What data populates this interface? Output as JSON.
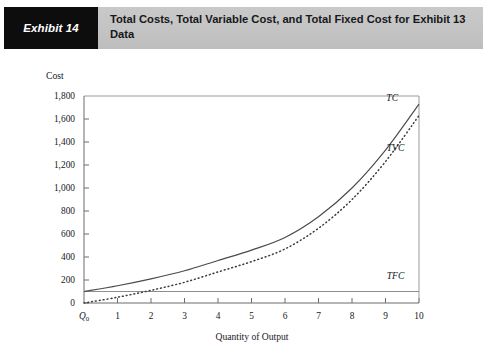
{
  "header": {
    "badge_label": "Exhibit 14",
    "title": "Total Costs, Total Variable Cost, and Total Fixed Cost for Exhibit 13 Data",
    "badge_bg": "#0d0d0d",
    "banner_bg": "#c4c4c4"
  },
  "chart_data": {
    "type": "line",
    "title": "Total Costs, Total Variable Cost, and Total Fixed Cost for Exhibit 13 Data",
    "xlabel": "Quantity of Output",
    "ylabel": "Cost",
    "xlim": [
      0,
      10
    ],
    "ylim": [
      0,
      1800
    ],
    "grid": false,
    "legend": "inline-curve-labels",
    "x": [
      0,
      1,
      2,
      3,
      4,
      5,
      6,
      7,
      8,
      9,
      10
    ],
    "x_tick_labels": [
      "Q₀",
      "1",
      "2",
      "3",
      "4",
      "5",
      "6",
      "7",
      "8",
      "9",
      "10"
    ],
    "y_tick_values": [
      0,
      200,
      400,
      600,
      800,
      1000,
      1200,
      1400,
      1600,
      1800
    ],
    "y_tick_labels": [
      "0",
      "200",
      "400",
      "600",
      "800",
      "1,000",
      "1,200",
      "1,400",
      "1,600",
      "1,800"
    ],
    "series": [
      {
        "name": "TC",
        "label": "TC",
        "style": "solid",
        "values": [
          100,
          150,
          210,
          280,
          370,
          460,
          570,
          750,
          1000,
          1330,
          1730
        ]
      },
      {
        "name": "TVC",
        "label": "TVC",
        "style": "dotted",
        "values": [
          0,
          50,
          110,
          180,
          270,
          360,
          470,
          650,
          900,
          1230,
          1630
        ]
      },
      {
        "name": "TFC",
        "label": "TFC",
        "style": "solid-flat",
        "values": [
          100,
          100,
          100,
          100,
          100,
          100,
          100,
          100,
          100,
          100,
          100
        ]
      }
    ],
    "annotations": [
      {
        "text": "TC",
        "x": 9.2,
        "y": 1760
      },
      {
        "text": "TVC",
        "x": 9.3,
        "y": 1320
      },
      {
        "text": "TFC",
        "x": 9.3,
        "y": 210
      }
    ]
  }
}
